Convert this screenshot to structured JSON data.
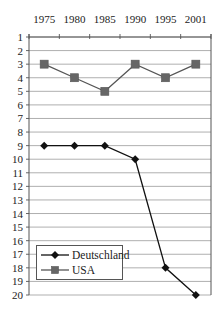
{
  "chart_data": {
    "type": "line",
    "title": "",
    "xlabel": "",
    "ylabel": "",
    "x_axis_position": "top",
    "y_axis_inverted": true,
    "categories": [
      "1975",
      "1980",
      "1985",
      "1990",
      "1995",
      "2001"
    ],
    "y_ticks": [
      1,
      2,
      3,
      4,
      5,
      6,
      7,
      8,
      9,
      10,
      11,
      12,
      13,
      14,
      15,
      16,
      17,
      18,
      19,
      20
    ],
    "ylim": [
      1,
      20
    ],
    "grid": "horizontal",
    "legend_position": "inside-lower-left",
    "series": [
      {
        "name": "Deutschland",
        "marker": "diamond",
        "color": "#111111",
        "values": [
          9,
          9,
          9,
          10,
          18,
          20
        ]
      },
      {
        "name": "USA",
        "marker": "square",
        "color": "#555555",
        "marker_color": "#666666",
        "values": [
          3,
          4,
          5,
          3,
          4,
          3
        ]
      }
    ]
  },
  "legend": {
    "items": [
      {
        "label": "Deutschland"
      },
      {
        "label": "USA"
      }
    ]
  }
}
